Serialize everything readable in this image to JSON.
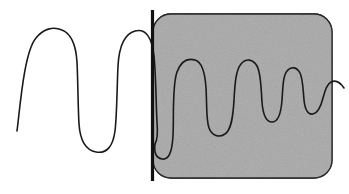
{
  "figure": {
    "kind": "signal-waveform-diagram",
    "width": 349,
    "height": 194,
    "background_color": "#ffffff"
  },
  "colors": {
    "page_background": "#ffffff",
    "trace_stroke": "#1a1a1a",
    "region_fill": "#a8a8a8",
    "region_border": "#2b2b2b",
    "divider_bar": "#111111",
    "noise_speckle": "#9a9a9a"
  },
  "divider_bar": {
    "name": "vertical-divider-bar",
    "x": 152.5,
    "y_top": 10,
    "y_bottom": 181,
    "thickness": 3.2,
    "color": "#111111"
  },
  "shaded_region": {
    "name": "highlighted-region",
    "x": 153,
    "y": 14,
    "width": 179,
    "height": 164,
    "corner_radius": 18,
    "fill": "#a8a8a8",
    "stroke": "#2b2b2b",
    "stroke_width": 1.3,
    "texture": "grainy-noise"
  },
  "trace": {
    "name": "signal-trace",
    "stroke": "#1a1a1a",
    "stroke_width": 1.6,
    "left_segment_path": "M 17,131 C 20,108 24,52 36,38 C 43,29 53,26 62,30 C 72,34 76,46 77,62 C 78,82 78,108 79,124 C 80,139 85,150 96,152 C 107,154 113,146 115,131 C 117,114 117,86 118,66 C 119,48 124,34 135,31 C 146,28 152,38 154,56 C 156,76 156,104 157,122 C 158,135 157,141 155,144",
    "right_segment_path": "M 155,144 C 154,152 156,158 162,159 C 169,160 172,152 173,136 C 174,116 172,86 177,72 C 181,61 188,58 195,60 C 202,62 205,72 206,88 C 207,104 206,120 209,128 C 212,136 219,138 225,134 C 231,130 233,118 234,100 C 235,82 236,70 241,64 C 246,58 253,59 257,66 C 261,73 261,88 262,102 C 263,115 266,122 272,122 C 278,122 281,114 282,100 C 283,86 283,76 287,71 C 291,66 297,67 300,73 C 303,79 303,90 304,100 C 305,110 308,115 313,114 C 318,113 321,106 323,98 C 325,90 327,84 331,82 C 335,80 340,82 344,88",
    "description": "Continuous trace: two broad rectangular pulses at left on white ground, then a damped oscillating burst of five progressively narrower pulses inside the shaded region"
  },
  "left_pulses": [
    {
      "name": "pulse-1",
      "x_start": 17,
      "x_rise": 36,
      "x_fall": 77,
      "x_end": 96,
      "top_y": 30,
      "bottom_y": 152
    },
    {
      "name": "pulse-2",
      "x_start": 96,
      "x_rise": 135,
      "x_fall": 156,
      "x_end": 162,
      "top_y": 31,
      "bottom_y": 152
    }
  ],
  "inner_pulses": [
    {
      "name": "inner-pulse-1",
      "peak_x": 191,
      "peak_y": 60,
      "trough_y": 130,
      "width": 30
    },
    {
      "name": "inner-pulse-2",
      "peak_x": 233,
      "peak_y": 64,
      "trough_y": 126,
      "width": 26
    },
    {
      "name": "inner-pulse-3",
      "peak_x": 262,
      "peak_y": 66,
      "trough_y": 122,
      "width": 21
    },
    {
      "name": "inner-pulse-4",
      "peak_x": 287,
      "peak_y": 71,
      "trough_y": 118,
      "width": 18
    },
    {
      "name": "inner-pulse-5",
      "peak_x": 326,
      "peak_y": 82,
      "trough_y": 114,
      "width": 15
    }
  ]
}
